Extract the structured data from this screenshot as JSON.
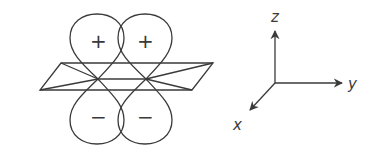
{
  "diagram": {
    "orbital": {
      "lobes": [
        {
          "position": "upper-left",
          "sign": "+"
        },
        {
          "position": "upper-right",
          "sign": "+"
        },
        {
          "position": "lower-left",
          "sign": "−"
        },
        {
          "position": "lower-right",
          "sign": "−"
        }
      ],
      "plane": "nodal-plane"
    },
    "axes": {
      "z_label": "z",
      "y_label": "y",
      "x_label": "x"
    },
    "colors": {
      "line": "#3a3a3a",
      "background": "#ffffff"
    }
  }
}
